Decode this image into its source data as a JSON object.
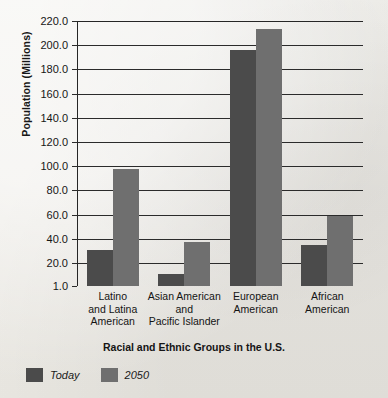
{
  "chart_data": {
    "type": "bar",
    "title": "",
    "xlabel": "Racial and Ethnic Groups in the U.S.",
    "ylabel": "Population (Millions)",
    "ylim": [
      1.0,
      220.0
    ],
    "grid": true,
    "legend_position": "bottom-left",
    "ytick_labels": [
      "220.0",
      "200.0",
      "180.0",
      "160.0",
      "140.0",
      "120.0",
      "100.0",
      "80.0",
      "60.0",
      "40.0",
      "20.0",
      "1.0"
    ],
    "ytick_values": [
      220.0,
      200.0,
      180.0,
      160.0,
      140.0,
      120.0,
      100.0,
      80.0,
      60.0,
      40.0,
      20.0,
      1.0
    ],
    "categories": [
      "Latino and Latina American",
      "Asian American and Pacific Islander",
      "European American",
      "African American"
    ],
    "category_lines": [
      [
        "Latino",
        "and Latina",
        "American"
      ],
      [
        "Asian American",
        "and",
        "Pacific Islander"
      ],
      [
        "European",
        "American"
      ],
      [
        "African",
        "American"
      ]
    ],
    "series": [
      {
        "name": "Today",
        "color": "#4b4b4b",
        "values": [
          31,
          11,
          196,
          35
        ]
      },
      {
        "name": "2050",
        "color": "#6f6f6f",
        "values": [
          98,
          37,
          213,
          59
        ]
      }
    ]
  },
  "legend": {
    "items": [
      {
        "label": "Today"
      },
      {
        "label": "2050"
      }
    ]
  }
}
